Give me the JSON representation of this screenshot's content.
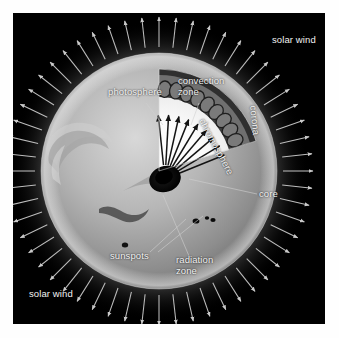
{
  "figure": {
    "kind": "labeled-cutaway-diagram",
    "plate_background": "#000000",
    "page_background": "#ffffff",
    "label_color": "#f2f2f2",
    "arrow_color": "#bdbdbd",
    "leader_color": "#cfcfcf"
  },
  "labels": {
    "solar_wind_top": "solar wind",
    "solar_wind_bottom": "solar wind",
    "photosphere": "photosphere",
    "convection_zone_l1": "convection",
    "convection_zone_l2": "zone",
    "chromosphere": "chromosphere",
    "corona": "corona",
    "core": "core",
    "sunspots": "sunspots",
    "radiation_zone_l1": "radiation",
    "radiation_zone_l2": "zone"
  },
  "structure": {
    "sun_center_x": 146,
    "sun_center_y": 158,
    "sun_radius": 118,
    "corona_inner_radius": 118,
    "corona_outer_radius": 150,
    "solar_wind_arrow_count": 56,
    "convection_cell_count": 9,
    "radiation_arrow_count": 9,
    "sunspot_count": 4,
    "cutaway_wedge_start_deg": -108,
    "cutaway_wedge_end_deg": -18
  }
}
